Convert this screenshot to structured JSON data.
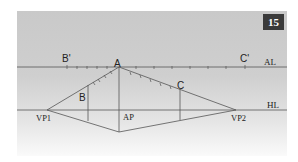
{
  "figure": {
    "number": "15",
    "panel_color_top": "#c9c9c9",
    "panel_color_bottom": "#fafafa",
    "line_color": "#555555",
    "badge_color": "#3a3a3a"
  },
  "labels": {
    "A": "A",
    "B_prime": "B'",
    "C_prime": "C'",
    "B": "B",
    "C": "C",
    "AL": "AL",
    "HL": "HL",
    "VP1": "VP1",
    "VP2": "VP2",
    "AP": "AP"
  },
  "geometry": {
    "AL_y": 67,
    "HL_y": 110,
    "A": [
      119,
      67
    ],
    "VP1": [
      47,
      110
    ],
    "VP2": [
      236,
      110
    ],
    "bottom": [
      119,
      132
    ],
    "B_x": 88,
    "C_x": 180,
    "B_prime_x": 67,
    "C_prime_x": 245
  }
}
